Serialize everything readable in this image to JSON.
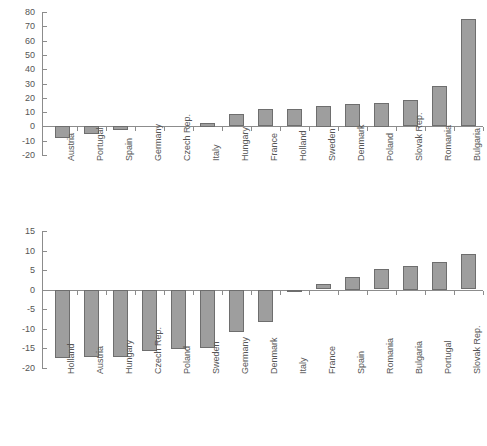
{
  "figure": {
    "title": "",
    "panel_count": 2
  },
  "chart_data": [
    {
      "id": "top",
      "type": "bar",
      "title": "",
      "xlabel": "",
      "ylabel": "",
      "orientation": "vertical",
      "grid": false,
      "legend": null,
      "ylim": [
        -20,
        80
      ],
      "ytick_step": 10,
      "yticks": [
        80,
        70,
        60,
        50,
        40,
        30,
        20,
        10,
        0,
        -10,
        -20
      ],
      "ytick_labels": [
        "80",
        "70",
        "60",
        "50",
        "40",
        "30",
        "20",
        "10",
        "0",
        "-10",
        "-20"
      ],
      "categories": [
        "Austria",
        "Portugal",
        "Spain",
        "Germany",
        "Czech Rep.",
        "Italy",
        "Hungary",
        "France",
        "Holland",
        "Sweden",
        "Denmark",
        "Poland",
        "Slovak Rep.",
        "Romania",
        "Bulgaria"
      ],
      "values": [
        -8.5,
        -5.5,
        -3.0,
        0.0,
        0.0,
        2.5,
        8.5,
        12.0,
        12.0,
        14.5,
        16.0,
        16.5,
        18.5,
        28.0,
        75.0
      ],
      "bar_color": "#9e9e9e",
      "bar_edge_color": "#6e6e6e",
      "axis_color": "#8c8c8c"
    },
    {
      "id": "bottom",
      "type": "bar",
      "title": "",
      "xlabel": "",
      "ylabel": "",
      "orientation": "vertical",
      "grid": false,
      "legend": null,
      "ylim": [
        -20,
        15
      ],
      "ytick_step": 5,
      "yticks": [
        15,
        10,
        5,
        0,
        -5,
        -10,
        -15,
        -20
      ],
      "ytick_labels": [
        "15",
        "10",
        "5",
        "0",
        "-5",
        "-10",
        "-15",
        "-20"
      ],
      "categories": [
        "Holland",
        "Austria",
        "Hungary",
        "Czech Rep.",
        "Poland",
        "Sweden",
        "Germany",
        "Denmark",
        "Italy",
        "France",
        "Spain",
        "Romania",
        "Bulgaria",
        "Portugal",
        "Slovak Rep."
      ],
      "values": [
        -17.3,
        -17.2,
        -17.2,
        -15.5,
        -15.0,
        -14.7,
        -10.8,
        -8.3,
        -0.4,
        1.4,
        3.2,
        5.2,
        6.1,
        7.1,
        9.0
      ],
      "bar_color": "#9e9e9e",
      "bar_edge_color": "#6e6e6e",
      "axis_color": "#8c8c8c"
    }
  ]
}
